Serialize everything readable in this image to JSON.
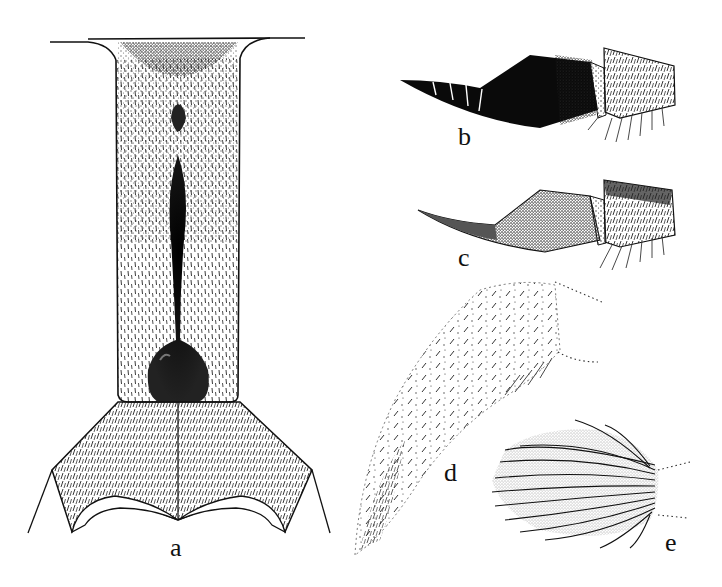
{
  "figure": {
    "panels": [
      {
        "id": "a",
        "label": "a",
        "description": "abdominal segment, dorsal view with dark median sclerite"
      },
      {
        "id": "b",
        "label": "b",
        "description": "ovipositor/terminal segments, dark form"
      },
      {
        "id": "c",
        "label": "c",
        "description": "ovipositor/terminal segments, light form"
      },
      {
        "id": "d",
        "label": "d",
        "description": "appendage with sparse setae"
      },
      {
        "id": "e",
        "label": "e",
        "description": "appendage with dense long setae"
      }
    ]
  },
  "colors": {
    "ink": "#111111",
    "background": "#ffffff",
    "stipple": "#333333"
  }
}
